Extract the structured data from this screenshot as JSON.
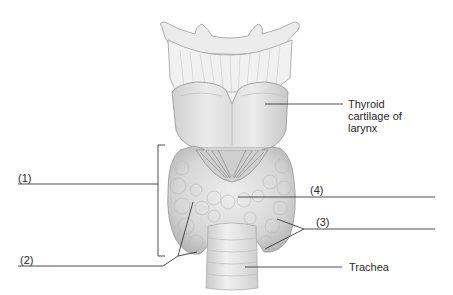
{
  "diagram": {
    "labels": {
      "thyroid_cartilage": {
        "line1": "Thyroid",
        "line2": "cartilage of",
        "line3": "larynx"
      },
      "label_1": "(1)",
      "label_2": "(2)",
      "label_3": "(3)",
      "label_4": "(4)",
      "trachea": "Trachea"
    },
    "colors": {
      "line": "#3a3a3a",
      "tissue_light": "#ececec",
      "tissue_mid": "#d4d4d4",
      "tissue_dark": "#a8a8a8",
      "text": "#2a2a2a"
    }
  }
}
